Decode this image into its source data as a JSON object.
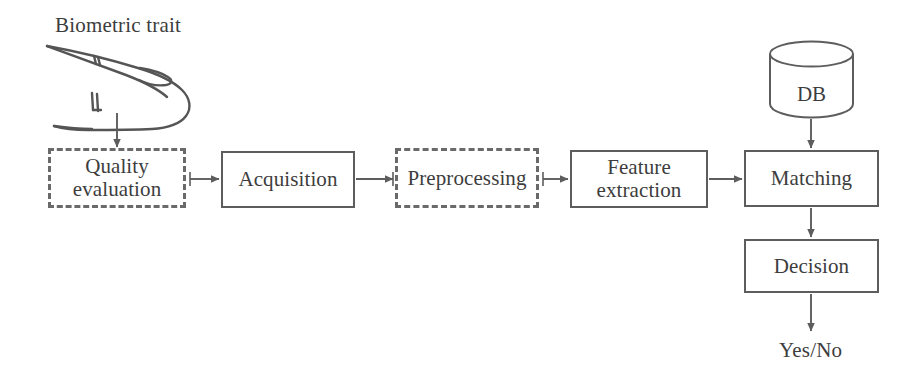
{
  "diagram": {
    "title_label": "Biometric trait",
    "output_label": "Yes/No",
    "db_label": "DB",
    "line_color": "#5d5d5d",
    "dashed_color": "#6a6a6a",
    "text_color": "#3d3d3d",
    "background": "#ffffff",
    "nodes": [
      {
        "id": "quality-evaluation",
        "label": "Quality\nevaluation",
        "style": "dashed",
        "x": 48,
        "y": 148,
        "w": 138,
        "h": 60
      },
      {
        "id": "acquisition",
        "label": "Acquisition",
        "style": "solid",
        "x": 221,
        "y": 151,
        "w": 134,
        "h": 57
      },
      {
        "id": "preprocessing",
        "label": "Preprocessing",
        "style": "dashed",
        "x": 395,
        "y": 148,
        "w": 144,
        "h": 60
      },
      {
        "id": "feature-extraction",
        "label": "Feature\nextraction",
        "style": "solid",
        "x": 570,
        "y": 150,
        "w": 138,
        "h": 58
      },
      {
        "id": "matching",
        "label": "Matching",
        "style": "solid",
        "x": 744,
        "y": 150,
        "w": 135,
        "h": 57
      },
      {
        "id": "decision",
        "label": "Decision",
        "style": "solid",
        "x": 744,
        "y": 239,
        "w": 135,
        "h": 54
      }
    ],
    "database": {
      "label": "DB",
      "x": 768,
      "y": 40,
      "w": 87,
      "h": 77
    },
    "connections": [
      {
        "from": "biometric-trait",
        "to": "quality-evaluation",
        "direction": "down"
      },
      {
        "from": "quality-evaluation",
        "to": "acquisition",
        "direction": "right"
      },
      {
        "from": "acquisition",
        "to": "preprocessing",
        "direction": "right"
      },
      {
        "from": "preprocessing",
        "to": "feature-extraction",
        "direction": "right"
      },
      {
        "from": "feature-extraction",
        "to": "matching",
        "direction": "right"
      },
      {
        "from": "database",
        "to": "matching",
        "direction": "down"
      },
      {
        "from": "matching",
        "to": "decision",
        "direction": "down"
      },
      {
        "from": "decision",
        "to": "output",
        "direction": "down"
      }
    ]
  }
}
